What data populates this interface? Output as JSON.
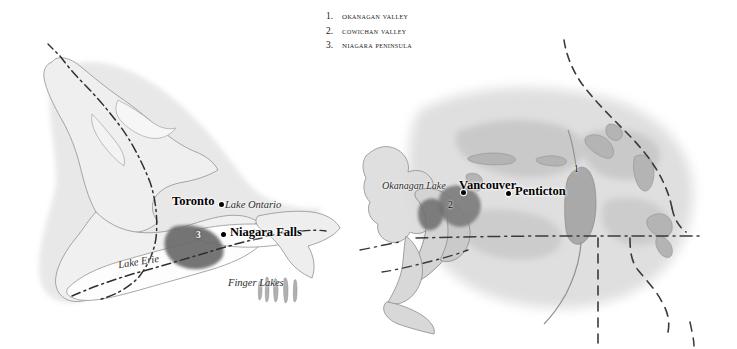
{
  "figure": {
    "background_color": "#ffffff"
  },
  "legend": {
    "items": [
      {
        "number": "1.",
        "label": "Okanagan Valley"
      },
      {
        "number": "2.",
        "label": "Cowichan Valley"
      },
      {
        "number": "3.",
        "label": "Niagara Peninsula"
      }
    ]
  },
  "colors": {
    "land_fill": "#ececec",
    "land_stroke": "#9a9a9a",
    "water_fill": "#ffffff",
    "highlight_region": "#6a6a6a",
    "terrain_shade": "#c9c9c9",
    "border_line": "#3a3a3a",
    "label_text": "#111111"
  },
  "maps": {
    "ontario": {
      "name": "Great Lakes / Niagara Peninsula",
      "cities": [
        {
          "name": "Toronto",
          "dot_side": "right"
        },
        {
          "name": "Niagara Falls",
          "dot_side": "left"
        }
      ],
      "water_labels": [
        {
          "name": "Lake Ontario"
        },
        {
          "name": "Lake Erie"
        },
        {
          "name": "Finger Lakes"
        }
      ],
      "region_markers": [
        {
          "number": "3",
          "region": "Niagara Peninsula"
        }
      ],
      "border_style": "dash-dot"
    },
    "bc": {
      "name": "British Columbia / Okanagan Valley",
      "cities": [
        {
          "name": "Vancouver",
          "dot_side": "left"
        },
        {
          "name": "Penticton",
          "dot_side": "left"
        }
      ],
      "water_labels": [
        {
          "name": "Okanagan Lake"
        }
      ],
      "region_markers": [
        {
          "number": "1",
          "region": "Okanagan Valley"
        },
        {
          "number": "2",
          "region": "Cowichan Valley"
        }
      ],
      "border_style": "dashed"
    }
  }
}
